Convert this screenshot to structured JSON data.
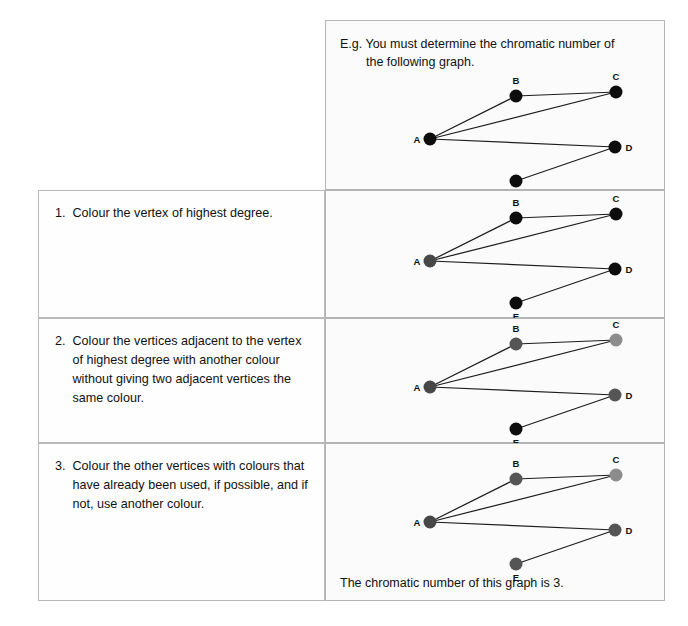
{
  "intro": {
    "line1": "E.g. You must determine the chromatic number of",
    "line2": "the following graph."
  },
  "steps": [
    {
      "number": "1.",
      "text": "Colour the vertex of highest degree."
    },
    {
      "number": "2.",
      "text": "Colour the vertices adjacent to the vertex of highest degree with another colour without giving two adjacent vertices the same colour."
    },
    {
      "number": "3.",
      "text": "Colour the other vertices with colours that have already been used, if possible, and if not, use another colour."
    }
  ],
  "caption": "The chromatic number of this graph is 3.",
  "graph": {
    "vertices": [
      {
        "id": "A",
        "label": "A",
        "x": 62,
        "y": 70,
        "label_dx": -13,
        "label_dy": 4
      },
      {
        "id": "B",
        "label": "B",
        "x": 148,
        "y": 27,
        "label_dx": 0,
        "label_dy": -12
      },
      {
        "id": "C",
        "label": "C",
        "x": 248,
        "y": 23,
        "label_dx": 0,
        "label_dy": -12
      },
      {
        "id": "D",
        "label": "D",
        "x": 247,
        "y": 78,
        "label_dx": 14,
        "label_dy": 4
      },
      {
        "id": "E",
        "label": "E",
        "x": 148,
        "y": 112,
        "label_dx": 0,
        "label_dy": 17
      }
    ],
    "edges": [
      [
        "A",
        "B"
      ],
      [
        "A",
        "C"
      ],
      [
        "A",
        "D"
      ],
      [
        "B",
        "C"
      ],
      [
        "D",
        "E"
      ]
    ],
    "radius": 6.5
  },
  "colors": {
    "uncoloured": "#0d0d0d",
    "colour1": "#474747",
    "colour2": "#555555",
    "colour3": "#8c8c8c",
    "edge": "#1d1d1d"
  },
  "colourings": {
    "step0": {
      "A": "uncoloured",
      "B": "uncoloured",
      "C": "uncoloured",
      "D": "uncoloured",
      "E": "uncoloured"
    },
    "step1": {
      "A": "colour1",
      "B": "uncoloured",
      "C": "uncoloured",
      "D": "uncoloured",
      "E": "uncoloured"
    },
    "step2": {
      "A": "colour1",
      "B": "colour2",
      "C": "colour3",
      "D": "colour2",
      "E": "uncoloured"
    },
    "step3": {
      "A": "colour1",
      "B": "colour2",
      "C": "colour3",
      "D": "colour2",
      "E": "colour2"
    }
  }
}
